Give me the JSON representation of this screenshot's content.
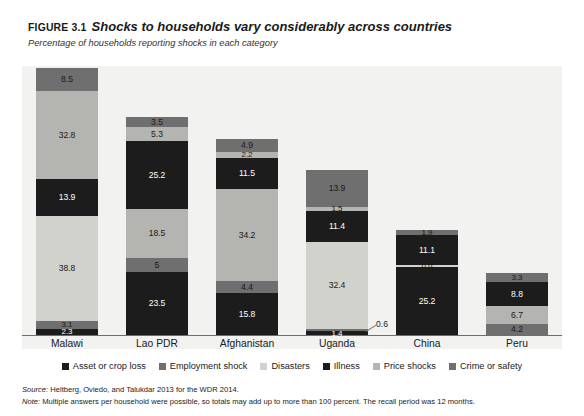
{
  "figure": {
    "label": "FIGURE 3.1",
    "title": "Shocks to households vary considerably across countries",
    "subtitle": "Percentage of households reporting shocks in each category"
  },
  "footer": {
    "source_label": "Source:",
    "source_text": " Heltberg, Oviedo, and Talukdar 2013 for the WDR 2014.",
    "note_label": "Note:",
    "note_text": " Multiple answers per household were possible, so totals may add up to more than 100 percent. The recall period was 12 months."
  },
  "colors": {
    "asset_or_crop_loss": "#1c1c1c",
    "employment_shock": "#6f6f6f",
    "disasters": "#d2d2cd",
    "illness": "#1c1c1c",
    "price_shocks": "#b4b4b0",
    "crime_or_safety": "#6f6f6f",
    "plot_background": "#f2f2f0",
    "axis": "#6d6d6d"
  },
  "chart_data": {
    "type": "bar",
    "subtype": "stacked-vertical",
    "title": "Shocks to households vary considerably across countries",
    "subtitle": "Percentage of households reporting shocks in each category",
    "xlabel": "",
    "ylabel": "Percentage of households reporting shocks in each category",
    "ylim": [
      0,
      100
    ],
    "grid": false,
    "legend_position": "bottom",
    "categories": [
      "Malawi",
      "Lao PDR",
      "Afghanistan",
      "Uganda",
      "China",
      "Peru"
    ],
    "series": [
      {
        "name": "Asset or crop loss",
        "color": "#1c1c1c",
        "values": [
          2.3,
          23.5,
          15.8,
          1.4,
          25.2,
          4.2
        ]
      },
      {
        "name": "Employment shock",
        "color": "#6f6f6f",
        "values": [
          3.1,
          5.0,
          4.4,
          0.6,
          0.6,
          4.2
        ]
      },
      {
        "name": "Disasters",
        "color": "#d2d2cd",
        "values": [
          38.8,
          18.5,
          34.2,
          32.4,
          0.6,
          6.7
        ]
      },
      {
        "name": "Illness",
        "color": "#1c1c1c",
        "values": [
          13.9,
          25.2,
          11.5,
          11.4,
          11.1,
          8.8
        ]
      },
      {
        "name": "Price shocks",
        "color": "#b4b4b0",
        "values": [
          32.8,
          5.3,
          2.2,
          1.5,
          0.0,
          3.3
        ]
      },
      {
        "name": "Crime or safety",
        "color": "#6f6f6f",
        "values": [
          8.5,
          3.5,
          4.9,
          13.9,
          1.9,
          3.3
        ]
      }
    ],
    "bars": [
      {
        "category": "Malawi",
        "total": 99.4,
        "segments": [
          {
            "label": "2.3",
            "value": 2.3,
            "series": "Asset or crop loss",
            "color": "#1c1c1c",
            "text_color": "#ffffff"
          },
          {
            "label": "3.1",
            "value": 3.1,
            "series": "Employment shock",
            "color": "#6f6f6f",
            "text_color": "#1a1a1a"
          },
          {
            "label": "38.8",
            "value": 38.8,
            "series": "Disasters",
            "color": "#d2d2cd",
            "text_color": "#1a1a1a"
          },
          {
            "label": "13.9",
            "value": 13.9,
            "series": "Illness",
            "color": "#1c1c1c",
            "text_color": "#ffffff"
          },
          {
            "label": "32.8",
            "value": 32.8,
            "series": "Price shocks",
            "color": "#b4b4b0",
            "text_color": "#1a1a1a"
          },
          {
            "label": "8.5",
            "value": 8.5,
            "series": "Crime or safety",
            "color": "#6f6f6f",
            "text_color": "#1a1a1a"
          }
        ]
      },
      {
        "category": "Lao PDR",
        "total": 81.0,
        "segments": [
          {
            "label": "23.5",
            "value": 23.5,
            "series": "Asset or crop loss",
            "color": "#1c1c1c",
            "text_color": "#ffffff"
          },
          {
            "label": "5",
            "value": 5.0,
            "series": "Employment shock",
            "color": "#6f6f6f",
            "text_color": "#1a1a1a"
          },
          {
            "label": "18.5",
            "value": 18.5,
            "series": "Disasters",
            "color": "#b4b4b0",
            "text_color": "#1a1a1a"
          },
          {
            "label": "25.2",
            "value": 25.2,
            "series": "Illness",
            "color": "#1c1c1c",
            "text_color": "#ffffff"
          },
          {
            "label": "5.3",
            "value": 5.3,
            "series": "Price shocks",
            "color": "#b4b4b0",
            "text_color": "#1a1a1a"
          },
          {
            "label": "3.5",
            "value": 3.5,
            "series": "Crime or safety",
            "color": "#6f6f6f",
            "text_color": "#1a1a1a"
          }
        ]
      },
      {
        "category": "Afghanistan",
        "total": 73.0,
        "segments": [
          {
            "label": "15.8",
            "value": 15.8,
            "series": "Asset or crop loss",
            "color": "#1c1c1c",
            "text_color": "#ffffff"
          },
          {
            "label": "4.4",
            "value": 4.4,
            "series": "Employment shock",
            "color": "#6f6f6f",
            "text_color": "#1a1a1a"
          },
          {
            "label": "34.2",
            "value": 34.2,
            "series": "Disasters",
            "color": "#b4b4b0",
            "text_color": "#1a1a1a"
          },
          {
            "label": "11.5",
            "value": 11.5,
            "series": "Illness",
            "color": "#1c1c1c",
            "text_color": "#ffffff"
          },
          {
            "label": "2.2",
            "value": 2.2,
            "series": "Price shocks",
            "color": "#b4b4b0",
            "text_color": "#1a1a1a"
          },
          {
            "label": "4.9",
            "value": 4.9,
            "series": "Crime or safety",
            "color": "#6f6f6f",
            "text_color": "#1a1a1a"
          }
        ]
      },
      {
        "category": "Uganda",
        "total": 61.2,
        "segments": [
          {
            "label": "1.4",
            "value": 1.4,
            "series": "Asset or crop loss",
            "color": "#1c1c1c",
            "text_color": "#ffffff"
          },
          {
            "label": "0.6",
            "value": 0.6,
            "series": "Employment shock",
            "color": "#6f6f6f",
            "text_color": "#1a1a1a",
            "callout": true
          },
          {
            "label": "32.4",
            "value": 32.4,
            "series": "Disasters",
            "color": "#d2d2cd",
            "text_color": "#1a1a1a"
          },
          {
            "label": "11.4",
            "value": 11.4,
            "series": "Illness",
            "color": "#1c1c1c",
            "text_color": "#ffffff"
          },
          {
            "label": "1.5",
            "value": 1.5,
            "series": "Price shocks",
            "color": "#b4b4b0",
            "text_color": "#1a1a1a"
          },
          {
            "label": "13.9",
            "value": 13.9,
            "series": "Crime or safety",
            "color": "#6f6f6f",
            "text_color": "#1a1a1a"
          }
        ]
      },
      {
        "category": "China",
        "total": 38.8,
        "segments": [
          {
            "label": "25.2",
            "value": 25.2,
            "series": "Asset or crop loss",
            "color": "#1c1c1c",
            "text_color": "#ffffff"
          },
          {
            "label": "0.6",
            "value": 0.6,
            "series": "Employment shock",
            "color": "#d2d2cd",
            "text_color": "#1a1a1a"
          },
          {
            "label": "11.1",
            "value": 11.1,
            "series": "Illness",
            "color": "#1c1c1c",
            "text_color": "#ffffff"
          },
          {
            "label": "1.9",
            "value": 1.9,
            "series": "Crime or safety",
            "color": "#6f6f6f",
            "text_color": "#1a1a1a"
          }
        ]
      },
      {
        "category": "Peru",
        "total": 23.0,
        "segments": [
          {
            "label": "4.2",
            "value": 4.2,
            "series": "Asset or crop loss",
            "color": "#6f6f6f",
            "text_color": "#1a1a1a"
          },
          {
            "label": "6.7",
            "value": 6.7,
            "series": "Disasters",
            "color": "#b4b4b0",
            "text_color": "#1a1a1a"
          },
          {
            "label": "8.8",
            "value": 8.8,
            "series": "Illness",
            "color": "#1c1c1c",
            "text_color": "#ffffff"
          },
          {
            "label": "3.3",
            "value": 3.3,
            "series": "Crime or safety",
            "color": "#6f6f6f",
            "text_color": "#1a1a1a"
          }
        ]
      }
    ]
  },
  "legend": {
    "items": [
      {
        "label": "Asset or crop loss",
        "color": "#1c1c1c"
      },
      {
        "label": "Employment shock",
        "color": "#6f6f6f"
      },
      {
        "label": "Disasters",
        "color": "#d2d2cd"
      },
      {
        "label": "Illness",
        "color": "#1c1c1c"
      },
      {
        "label": "Price shocks",
        "color": "#b4b4b0"
      },
      {
        "label": "Crime or safety",
        "color": "#6f6f6f"
      }
    ]
  }
}
